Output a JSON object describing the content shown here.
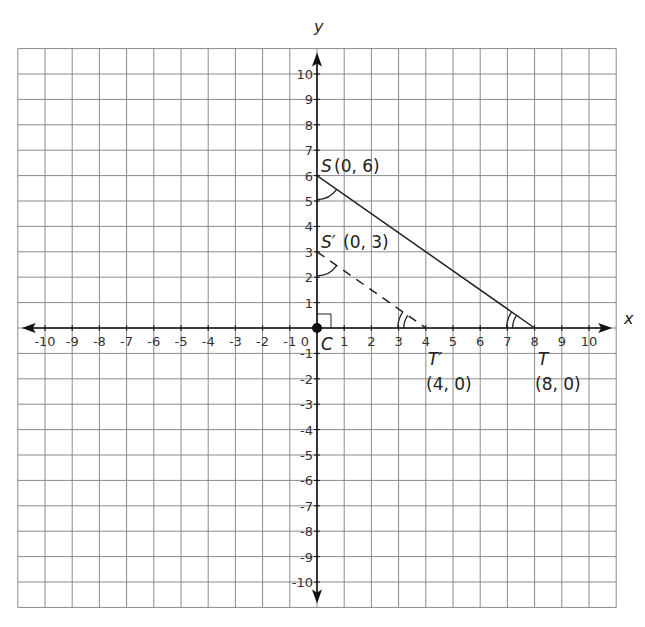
{
  "chart_data": {
    "type": "coordinate-plane",
    "xlabel": "x",
    "ylabel": "y",
    "xlim": [
      -10,
      10
    ],
    "ylim": [
      -10,
      10
    ],
    "grid": true,
    "x_ticks": [
      -10,
      -9,
      -8,
      -7,
      -6,
      -5,
      -4,
      -3,
      -2,
      -1,
      0,
      1,
      2,
      3,
      4,
      5,
      6,
      7,
      8,
      9,
      10
    ],
    "y_ticks": [
      -10,
      -9,
      -8,
      -7,
      -6,
      -5,
      -4,
      -3,
      -2,
      -1,
      1,
      2,
      3,
      4,
      5,
      6,
      7,
      8,
      9,
      10
    ],
    "points": [
      {
        "name": "C",
        "x": 0,
        "y": 0,
        "label": "C"
      },
      {
        "name": "S",
        "x": 0,
        "y": 6,
        "label": "S",
        "coords": "(0, 6)"
      },
      {
        "name": "S'",
        "x": 0,
        "y": 3,
        "label": "S′",
        "coords": "(0, 3)"
      },
      {
        "name": "T",
        "x": 8,
        "y": 0,
        "label": "T",
        "coords": "(8, 0)"
      },
      {
        "name": "T'",
        "x": 4,
        "y": 0,
        "label": "T′",
        "coords": "(4, 0)"
      }
    ],
    "segments": [
      {
        "from": "S",
        "to": "T",
        "style": "solid"
      },
      {
        "from": "S'",
        "to": "T'",
        "style": "dashed"
      }
    ],
    "annotations": [
      "right angle at C",
      "single arc angle marks at S and S'",
      "double arc angle marks at T and T'"
    ]
  },
  "labels": {
    "x_axis": "x",
    "y_axis": "y",
    "C": "C",
    "S": "S",
    "S_coords": "(0, 6)",
    "Sp": "S′",
    "Sp_coords": "(0, 3)",
    "T": "T",
    "T_coords": "(8, 0)",
    "Tp": "T′",
    "Tp_coords": "(4, 0)"
  }
}
